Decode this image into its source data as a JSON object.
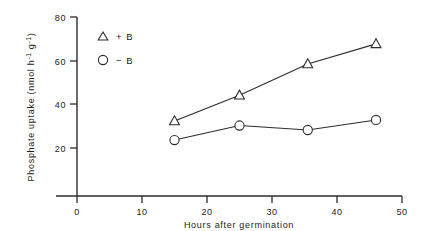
{
  "chart_data": {
    "type": "line",
    "title": "",
    "xlabel": "Hours after germination",
    "ylabel": "Phosphate uptake (nmol h⁻¹ g⁻¹)",
    "ylabel_parts": {
      "main": "Phosphate uptake (nmol h",
      "sup1": "-1",
      "mid": " g",
      "sup2": "-1",
      "tail": ")"
    },
    "xlim": [
      0,
      50
    ],
    "ylim": [
      0,
      80
    ],
    "grid": false,
    "legend_position": "upper-left-inside",
    "xticks": [
      "0",
      "10",
      "20",
      "30",
      "40",
      "50"
    ],
    "xtick_values": [
      0,
      10,
      20,
      30,
      40,
      50
    ],
    "yticks": [
      "20",
      "40",
      "60",
      "80"
    ],
    "ytick_values": [
      20,
      40,
      60,
      80
    ],
    "series": [
      {
        "name": "+ B",
        "marker": "triangle",
        "x": [
          15,
          25,
          35.5,
          46
        ],
        "values": [
          33.5,
          45,
          59,
          68
        ]
      },
      {
        "name": "- B",
        "marker": "circle",
        "x": [
          15,
          25,
          35.5,
          46
        ],
        "values": [
          25,
          31.5,
          29.5,
          34
        ]
      }
    ],
    "legend": [
      {
        "symbol": "triangle",
        "label": "+ B"
      },
      {
        "symbol": "circle",
        "label": "− B"
      }
    ]
  }
}
